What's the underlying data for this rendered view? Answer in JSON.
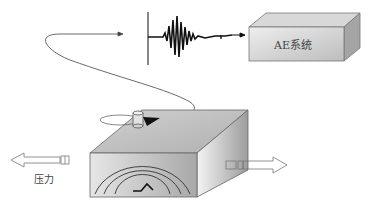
{
  "diagram": {
    "ae_system_label": "AE系统",
    "pressure_label": "压力",
    "elements": {
      "ae_system_box": "3D gray box labeled AE系统 (top right)",
      "waveform": "burst-type AE signal with baseline marker and arrow to AE system",
      "cable": "curved line from sensor on specimen to waveform origin",
      "sensor": "cylindrical AE sensor with black triangular connector on top of specimen",
      "specimen": "3D gray block with concentric wave arcs and crack symbol on front face",
      "left_arrow": "hollow arrow pointing left (pressure/load)",
      "right_arrow": "hollow arrow pointing right (pressure/load)"
    }
  },
  "colors": {
    "box_front": "#c8c8c8",
    "box_top": "#dadada",
    "box_side": "#9a9a9a",
    "line": "#333333"
  }
}
